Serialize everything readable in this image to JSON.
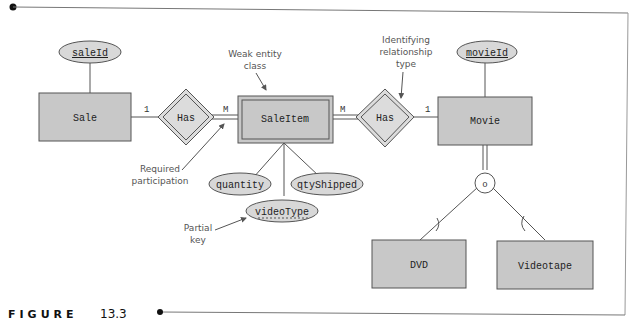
{
  "figure": {
    "label": "FIGURE",
    "number": "13.3"
  },
  "colors": {
    "entity_fill": "#c8c8c8",
    "relationship_fill": "#dcdcdc",
    "attribute_fill": "#d8d8d8",
    "stroke": "#555555",
    "frame": "#777777"
  },
  "entities": [
    {
      "id": "sale",
      "label": "Sale",
      "weak": false
    },
    {
      "id": "saleitem",
      "label": "SaleItem",
      "weak": true
    },
    {
      "id": "movie",
      "label": "Movie",
      "weak": false
    },
    {
      "id": "dvd",
      "label": "DVD",
      "weak": false
    },
    {
      "id": "videotape",
      "label": "Videotape",
      "weak": false
    }
  ],
  "relationships": [
    {
      "id": "has1",
      "label": "Has",
      "identifying": true
    },
    {
      "id": "has2",
      "label": "Has",
      "identifying": true
    }
  ],
  "attributes": [
    {
      "id": "saleId",
      "label": "saleId",
      "key": "primary"
    },
    {
      "id": "movieId",
      "label": "movieId",
      "key": "primary"
    },
    {
      "id": "quantity",
      "label": "quantity",
      "key": "none"
    },
    {
      "id": "qtyShipped",
      "label": "qtyShipped",
      "key": "none"
    },
    {
      "id": "videoType",
      "label": "videoType",
      "key": "partial"
    }
  ],
  "cardinalities": {
    "sale_has1": "1",
    "has1_saleitem": "M",
    "saleitem_has2": "M",
    "has2_movie": "1"
  },
  "specialization": {
    "symbol": "o"
  },
  "annotations": {
    "weak_entity": [
      "Weak entity",
      "class"
    ],
    "identifying": [
      "Identifying",
      "relationship",
      "type"
    ],
    "required": [
      "Required",
      "participation"
    ],
    "partial_key": [
      "Partial",
      "key"
    ]
  }
}
